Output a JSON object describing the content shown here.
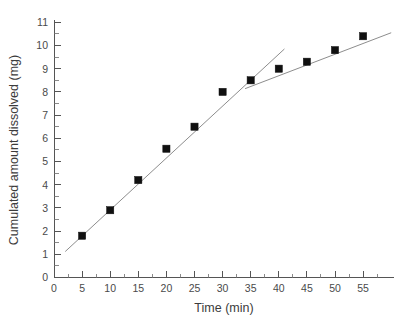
{
  "chart_data": {
    "type": "scatter",
    "title": "",
    "xlabel": "Time (min)",
    "ylabel": "Cumulated amount dissolved (mg)",
    "xlim": [
      0,
      57
    ],
    "ylim": [
      0,
      11
    ],
    "xticks": [
      0,
      5,
      10,
      15,
      20,
      25,
      30,
      35,
      40,
      45,
      50,
      55
    ],
    "yticks": [
      0,
      1,
      2,
      3,
      4,
      5,
      6,
      7,
      8,
      9,
      10,
      11
    ],
    "xtick_labels": [
      "0",
      "5",
      "10",
      "15",
      "20",
      "25",
      "30",
      "35",
      "40",
      "45",
      "50",
      "55"
    ],
    "ytick_labels": [
      "0",
      "1",
      "2",
      "3",
      "4",
      "5",
      "6",
      "7",
      "8",
      "9",
      "10",
      "11"
    ],
    "minor_ticks": true,
    "grid": false,
    "legend": false,
    "marker_style": "filled-square",
    "marker_color": "#101010",
    "fit_line_color": "#8d8d8d",
    "x": [
      5,
      10,
      15,
      20,
      25,
      30,
      35,
      40,
      45,
      50,
      55
    ],
    "values": [
      1.8,
      2.9,
      4.2,
      5.55,
      6.5,
      8.0,
      8.5,
      9.0,
      9.3,
      9.8,
      10.4
    ],
    "series": [
      {
        "name": "Cumulated amount dissolved",
        "x": [
          5,
          10,
          15,
          20,
          25,
          30,
          35,
          40,
          45,
          50,
          55
        ],
        "values": [
          1.8,
          2.9,
          4.2,
          5.55,
          6.5,
          8.0,
          8.5,
          9.0,
          9.3,
          9.8,
          10.4
        ]
      }
    ],
    "fit_lines": [
      {
        "name": "burst-phase-linear-fit",
        "x": [
          2.0,
          41.0
        ],
        "y": [
          1.12,
          9.85
        ]
      },
      {
        "name": "plateau-phase-linear-fit",
        "x": [
          34.0,
          60.0
        ],
        "y": [
          8.14,
          10.55
        ]
      }
    ]
  },
  "axes": {
    "x_title": "Time (min)",
    "y_title": "Cumulated amount dissolved (mg)"
  }
}
